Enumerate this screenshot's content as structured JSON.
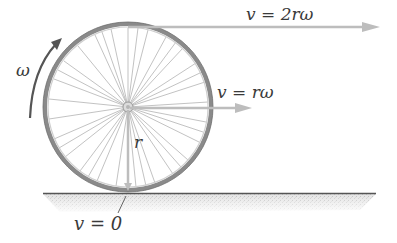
{
  "diagram": {
    "labels": {
      "top_velocity": "v = 2rω",
      "center_velocity": "v = rω",
      "contact_velocity": "v = 0",
      "radius": "r",
      "angular_velocity": "ω"
    },
    "colors": {
      "arrow": "#bdbdbd",
      "tire": "#8a8a8a",
      "spoke": "#a8a8a8",
      "ground": "#555555",
      "ground_shade": "#cfcfcf",
      "omega_arrow": "#555555",
      "text": "#3a3a3a"
    }
  }
}
